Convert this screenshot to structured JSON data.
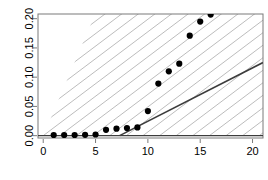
{
  "chart_data": {
    "type": "scatter",
    "title": "",
    "subtitle": "",
    "xlabel": "",
    "ylabel": "",
    "xlim": [
      -0.5,
      21.0
    ],
    "ylim": [
      -0.004,
      0.208
    ],
    "grid": false,
    "legend": null,
    "x_ticks": [
      0,
      5,
      10,
      15,
      20
    ],
    "x_tick_labels": [
      "0",
      "5",
      "10",
      "15",
      "20"
    ],
    "y_ticks": [
      0.0,
      0.05,
      0.1,
      0.15,
      0.2
    ],
    "y_tick_labels": [
      "0.00",
      "0.05",
      "0.10",
      "0.15",
      "0.20"
    ],
    "series": [
      {
        "name": "points",
        "type": "scatter",
        "marker": "filled-circle",
        "color": "#000000",
        "x": [
          1,
          2,
          3,
          4,
          5,
          6,
          7,
          8,
          9,
          10,
          11,
          12,
          13,
          14,
          15,
          16
        ],
        "y": [
          0.001,
          0.001,
          0.001,
          0.0015,
          0.002,
          0.01,
          0.012,
          0.013,
          0.014,
          0.042,
          0.089,
          0.11,
          0.123,
          0.171,
          0.195,
          0.207
        ]
      },
      {
        "name": "fitted-line",
        "type": "line",
        "color": "#3c3c3c",
        "width": 1.6,
        "x": [
          7.3,
          21.0
        ],
        "y": [
          0.0,
          0.125
        ]
      },
      {
        "name": "zero-line",
        "type": "line",
        "color": "#3c3c3c",
        "width": 1.4,
        "x": [
          -0.5,
          21.0
        ],
        "y": [
          0.0,
          0.0
        ]
      }
    ],
    "shaded_region": {
      "name": "hatched-cone",
      "fill": "hatch",
      "hatch_color": "#b4b4b4",
      "hatch_angle_deg": 37,
      "hatch_spacing_px": 10,
      "description": "hatched wedge from origin fanning up and to the right"
    },
    "annotations": []
  },
  "axes": {
    "frame_color": "#7a7a7a",
    "tick_color": "#7a7a7a",
    "point_color": "#000000",
    "line_color": "#3c3c3c",
    "hatch_color": "#b4b4b4",
    "background": "#ffffff"
  }
}
